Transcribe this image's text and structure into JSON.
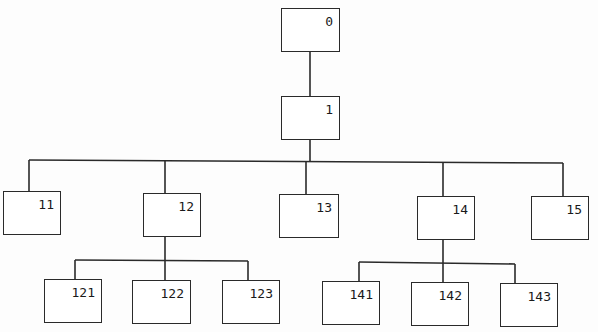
{
  "diagram": {
    "type": "tree",
    "line_color": "#2a2a2a",
    "nodes": [
      {
        "id": "0",
        "label": "0",
        "x": 281,
        "y": 8,
        "w": 59,
        "h": 44,
        "parent": null
      },
      {
        "id": "1",
        "label": "1",
        "x": 281,
        "y": 96,
        "w": 59,
        "h": 44,
        "parent": "0"
      },
      {
        "id": "11",
        "label": "11",
        "x": 3,
        "y": 191,
        "w": 58,
        "h": 44,
        "parent": "1"
      },
      {
        "id": "12",
        "label": "12",
        "x": 143,
        "y": 193,
        "w": 58,
        "h": 44,
        "parent": "1"
      },
      {
        "id": "13",
        "label": "13",
        "x": 279,
        "y": 194,
        "w": 60,
        "h": 44,
        "parent": "1"
      },
      {
        "id": "14",
        "label": "14",
        "x": 417,
        "y": 196,
        "w": 58,
        "h": 44,
        "parent": "1"
      },
      {
        "id": "15",
        "label": "15",
        "x": 531,
        "y": 196,
        "w": 58,
        "h": 44,
        "parent": "1"
      },
      {
        "id": "121",
        "label": "121",
        "x": 44,
        "y": 279,
        "w": 58,
        "h": 44,
        "parent": "12"
      },
      {
        "id": "122",
        "label": "122",
        "x": 132,
        "y": 280,
        "w": 59,
        "h": 44,
        "parent": "12"
      },
      {
        "id": "123",
        "label": "123",
        "x": 222,
        "y": 280,
        "w": 58,
        "h": 44,
        "parent": "12"
      },
      {
        "id": "141",
        "label": "141",
        "x": 322,
        "y": 281,
        "w": 58,
        "h": 44,
        "parent": "14"
      },
      {
        "id": "142",
        "label": "142",
        "x": 411,
        "y": 282,
        "w": 58,
        "h": 44,
        "parent": "14"
      },
      {
        "id": "143",
        "label": "143",
        "x": 500,
        "y": 283,
        "w": 58,
        "h": 44,
        "parent": "14"
      }
    ]
  }
}
